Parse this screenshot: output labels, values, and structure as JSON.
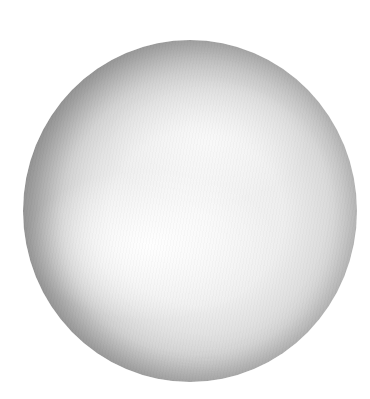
{
  "image": {
    "subject": "shaded grey sphere",
    "background_color": "#ffffff",
    "sphere": {
      "center_x": 190,
      "center_y": 211,
      "radius_x": 167,
      "radius_y": 171,
      "rim_color": "#6e6e6e",
      "highlight_color": "#f6f6f6"
    }
  }
}
